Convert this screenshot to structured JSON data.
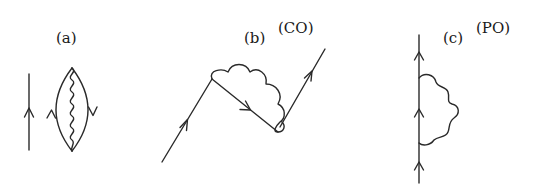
{
  "figure": {
    "panels": [
      {
        "id": "a",
        "label": "(a)",
        "tag": "",
        "description": "Separate upward fermion line beside a closed fermion loop with an internal wavy interaction line connecting the top and bottom vertices"
      },
      {
        "id": "b",
        "label": "(b)",
        "tag": "(CO)",
        "description": "Zig-zag fermion line with a wavy interaction line spanning the middle segment (crossed/connected self-energy)"
      },
      {
        "id": "c",
        "label": "(c)",
        "tag": "(PO)",
        "description": "Vertical upward fermion line with a wavy self-energy loop attached on the right"
      }
    ],
    "colors": {
      "ink": "#2a2a2a",
      "background": "#ffffff"
    }
  }
}
